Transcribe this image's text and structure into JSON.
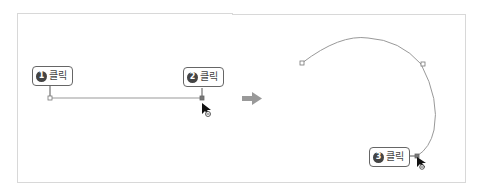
{
  "diagram": {
    "step1": {
      "number": "1",
      "label": "클릭"
    },
    "step2": {
      "number": "2",
      "label": "클릭"
    },
    "step3": {
      "number": "3",
      "label": "클릭"
    }
  },
  "colors": {
    "line": "#999999",
    "anchor": "#777777",
    "callout_border": "#666666",
    "badge": "#444444",
    "arrow": "#999999"
  }
}
